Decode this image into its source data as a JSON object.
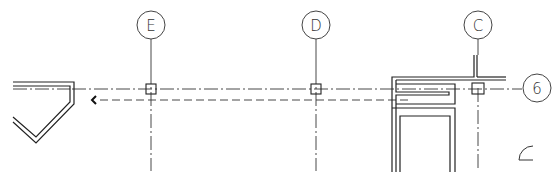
{
  "drawing": {
    "type": "architectural floor plan fragment",
    "grid_bubbles": {
      "vertical": [
        {
          "id": "E",
          "label": "E"
        },
        {
          "id": "D",
          "label": "D"
        },
        {
          "id": "C",
          "label": "C"
        }
      ],
      "horizontal": [
        {
          "id": "6",
          "label": "6"
        }
      ]
    },
    "colors": {
      "line": "#222222",
      "background": "#ffffff"
    }
  }
}
